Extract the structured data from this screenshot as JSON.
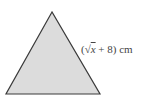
{
  "diagram": {
    "shape": "equilateral-triangle",
    "fill": "#dcdcdc",
    "stroke": "#3a3a3a",
    "side_label": {
      "open": "(",
      "radical": "√",
      "radicand": "x",
      "rest": " + 8) cm"
    }
  }
}
